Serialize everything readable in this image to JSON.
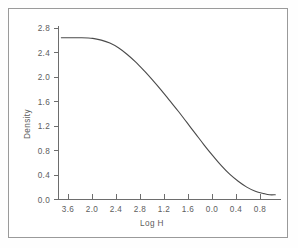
{
  "chart_data": {
    "type": "line",
    "title": "",
    "subtitle": "",
    "xlabel": "Log H",
    "ylabel": "Density",
    "grid": false,
    "legend": false,
    "x_tick_labels": [
      "3.6",
      "2.0",
      "2.4",
      "2.8",
      "1.2",
      "1.6",
      "0.0",
      "0.4",
      "0.8"
    ],
    "y_tick_labels": [
      "2.8",
      "2.4",
      "2.0",
      "1.6",
      "1.2",
      "0.8",
      "0.4",
      "0.0"
    ],
    "x_tick_values": [
      3.6,
      3.2,
      2.8,
      2.4,
      2.0,
      1.6,
      1.2,
      0.8,
      0.4,
      0.0
    ],
    "y_tick_values": [
      2.8,
      2.4,
      2.0,
      1.6,
      1.2,
      0.8,
      0.4,
      0.0
    ],
    "xlim": [
      3.8,
      -0.1
    ],
    "ylim": [
      0.0,
      2.95
    ],
    "x_axis_direction": "decreasing",
    "series": [
      {
        "name": "characteristic-curve",
        "color": "#4a4a4a",
        "x": [
          3.75,
          3.6,
          3.4,
          3.2,
          3.05,
          2.9,
          2.75,
          2.6,
          2.45,
          2.3,
          2.15,
          2.0,
          1.85,
          1.7,
          1.55,
          1.4,
          1.25,
          1.1,
          0.95,
          0.8,
          0.65,
          0.5,
          0.35,
          0.2,
          0.1,
          0.0
        ],
        "y": [
          2.75,
          2.75,
          2.75,
          2.74,
          2.71,
          2.66,
          2.58,
          2.47,
          2.34,
          2.19,
          2.03,
          1.86,
          1.68,
          1.5,
          1.31,
          1.12,
          0.93,
          0.75,
          0.58,
          0.43,
          0.31,
          0.21,
          0.14,
          0.1,
          0.08,
          0.08
        ]
      }
    ],
    "annotations": {
      "shoulder_density": 2.75,
      "toe_density": 0.08
    }
  },
  "figure": {
    "border_color": "#9a9a9a",
    "axis_color": "#6d6d6d",
    "curve_color": "#4a4a4a",
    "background": "#ffffff"
  }
}
